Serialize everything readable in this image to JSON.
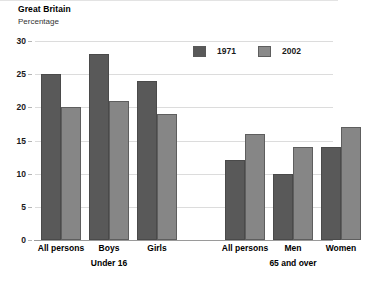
{
  "header": {
    "title": "Great Britain",
    "subtitle": "Percentage"
  },
  "legend": {
    "position": "top-right",
    "entries": [
      {
        "label": "1971",
        "color": "#595959"
      },
      {
        "label": "2002",
        "color": "#868686"
      }
    ]
  },
  "chart_data": {
    "type": "bar",
    "title": "Great Britain",
    "subtitle": "Percentage",
    "xlabel": "",
    "ylabel": "Percentage",
    "ylim": [
      0,
      30
    ],
    "yticks": [
      0,
      5,
      10,
      15,
      20,
      25,
      30
    ],
    "grid": true,
    "legend_position": "top-right",
    "categories": [
      "All persons",
      "Boys",
      "Girls",
      "All persons",
      "Men",
      "Women"
    ],
    "groups": [
      {
        "name": "Under 16",
        "categories": [
          "All persons",
          "Boys",
          "Girls"
        ]
      },
      {
        "name": "65 and over",
        "categories": [
          "All persons",
          "Men",
          "Women"
        ]
      }
    ],
    "series": [
      {
        "name": "1971",
        "color": "#595959",
        "values": [
          25,
          28,
          24,
          12,
          10,
          14
        ]
      },
      {
        "name": "2002",
        "color": "#868686",
        "values": [
          20,
          21,
          19,
          16,
          14,
          17
        ]
      }
    ]
  }
}
